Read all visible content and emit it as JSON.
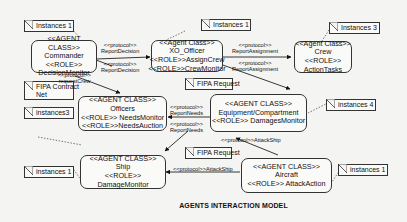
{
  "title": "AGENTS INTERACTION MODEL",
  "agents": {
    "commander": {
      "stereotype": "<<AGENT CLASS>>",
      "name": "Commander",
      "role_label": "<<ROLE>>",
      "role": "DecisionMonitor"
    },
    "xo_officer": {
      "stereotype": "<<Agent Class>>",
      "name": "XO_Officer",
      "role1": "<<ROLE>>AssignCrew",
      "role2": "<<ROLE>>CrewMonitor"
    },
    "crew": {
      "stereotype": "<<Agent Class>>",
      "name": "Crew",
      "role_label": "<<ROLE>>",
      "role": "ActionTasks"
    },
    "officers": {
      "stereotype": "<<AGENT CLASS>>",
      "name": "Officers",
      "role1": "<<ROLE>> NeedsMonitor",
      "role2": "<<ROLE>>NeedsAuction"
    },
    "equipment": {
      "stereotype": "<<AGENT CLASS>>",
      "name": "Equipment/Compartment",
      "role": "<<ROLE>> DamagesMonitor"
    },
    "ship": {
      "stereotype": "<<AGENT CLASS>>",
      "name": "Ship",
      "role": "<<ROLE>> DamageMonitor"
    },
    "aircraft": {
      "stereotype": "<<AGENT CLASS>>",
      "name": "Aircraft",
      "role": "<<ROLE>> AttackAction"
    }
  },
  "notes": {
    "commander_instances": "Instances 1",
    "xo_instances": "Instances 1",
    "crew_instances": "Instances 3",
    "fipa_contract_net_1": "FIPA Contract",
    "fipa_contract_net_2": "Net",
    "officers_instances": "instances3",
    "fipa_request_1": "FIPA Request",
    "equipment_instances": "instances 4",
    "ship_instances": "instances 1",
    "fipa_request_2": "FIPA Request",
    "aircraft_instances": "instances 1"
  },
  "protocols": {
    "report_decision_top": {
      "stereotype": "<<protocol>>",
      "name": "ReportDecision"
    },
    "report_decision_bottom": {
      "stereotype": "<<protocol>>",
      "name": "ReportDecision"
    },
    "report_assignment_top": {
      "stereotype": "<<protocol>>",
      "name": "ReportAssignment"
    },
    "report_assignment_bottom": {
      "stereotype": "<<protocol>>",
      "name": "ReportAssignment"
    },
    "request_crew": {
      "stereotype": "<<protocol>>",
      "name": "requestCrew"
    },
    "report_needs_top": {
      "stereotype": "<<protocol>>",
      "name": "ReportNeeds"
    },
    "report_needs_bottom": {
      "stereotype": "<<protocol>>",
      "name": "ReportNeeds"
    },
    "attack_ship_top": {
      "label": "<<protocol>>AttackShip"
    },
    "attack_ship_bottom": {
      "label": "<<protocol>>AttackShip"
    }
  }
}
